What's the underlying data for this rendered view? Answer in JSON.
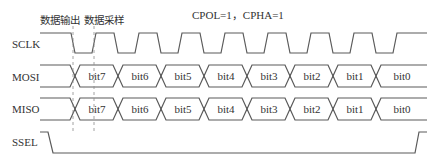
{
  "title": "CPOL=1，CPHA=1",
  "annotations": {
    "data_output": "数据输出",
    "data_sample": "数据采样"
  },
  "signals": {
    "sclk": "SCLK",
    "mosi": "MOSI",
    "miso": "MISO",
    "ssel": "SSEL"
  },
  "mosi_bits": [
    "bit7",
    "bit6",
    "bit5",
    "bit4",
    "bit3",
    "bit2",
    "bit1",
    "bit0"
  ],
  "miso_bits": [
    "bit7",
    "bit6",
    "bit5",
    "bit4",
    "bit3",
    "bit2",
    "bit1",
    "bit0"
  ],
  "colors": {
    "line": "#5a5a5a",
    "text": "#333333",
    "background": "#ffffff"
  }
}
